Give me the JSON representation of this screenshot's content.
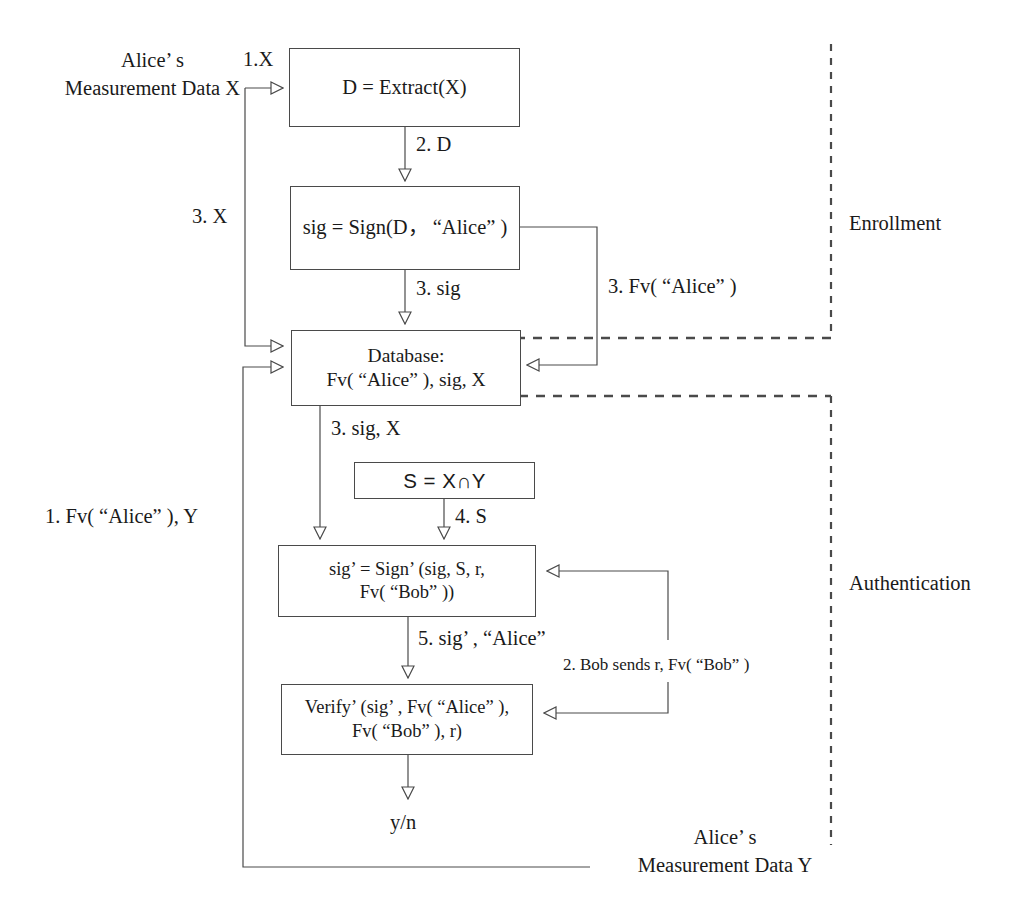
{
  "diagram": {
    "phases": [
      {
        "name": "enrollment",
        "label": "Enrollment"
      },
      {
        "name": "authentication",
        "label": "Authentication"
      }
    ],
    "boxes": [
      {
        "name": "extract",
        "text": "D = Extract(X)"
      },
      {
        "name": "sign",
        "text": "sig = Sign(D， “Alice” )"
      },
      {
        "name": "database",
        "text": "Database:\nFv( “Alice” ), sig, X"
      },
      {
        "name": "intersect",
        "text": "S = X∩Y"
      },
      {
        "name": "sign-prime",
        "text": "sig’ = Sign’ (sig, S, r,\nFv( “Bob” ))"
      },
      {
        "name": "verify-prime",
        "text": "Verify’ (sig’ , Fv( “Alice” ),\nFv( “Bob” ), r)"
      }
    ],
    "labels": {
      "alice_data_x": "Alice’ s\nMeasurement Data X",
      "alice_data_y": "Alice’ s\nMeasurement Data Y",
      "step1_x": "1.X",
      "step2_d": "2. D",
      "step3_x": "3. X",
      "step3_sig": "3. sig",
      "step3_fv_alice": "3. Fv( “Alice” )",
      "step3_sig_x": "3. sig, X",
      "step4_s": "4. S",
      "step5_sig_alice": "5. sig’ , “Alice”",
      "step1_fv_alice_y": "1. Fv( “Alice” ), Y",
      "step2_bob": "2. Bob sends r, Fv( “Bob” )",
      "result": "y/n"
    },
    "colors": {
      "line": "#4a4a4a",
      "text": "#1a1a1a",
      "background": "#ffffff"
    }
  }
}
